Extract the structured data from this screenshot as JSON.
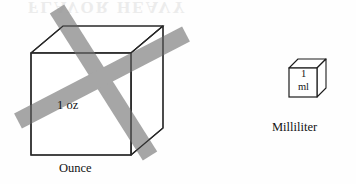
{
  "figure": {
    "background_color": "#fefefe",
    "ghost_bleed_text": "FLAVOR HEAVY",
    "stroke_color": "#1c1c1c",
    "cross_out_color": "#9a9a9a"
  },
  "ounce": {
    "value_label": "1 oz",
    "caption": "Ounce",
    "crossed_out": true,
    "cross_out_mark": "x-cross-out"
  },
  "milliliter": {
    "value_number": "1",
    "value_unit": "ml",
    "caption": "Milliliter",
    "crossed_out": false
  }
}
